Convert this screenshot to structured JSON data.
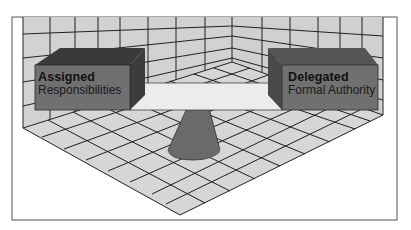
{
  "figure": {
    "left_box": {
      "title": "Assigned",
      "subtitle": "Responsibilities"
    },
    "right_box": {
      "title": "Delegated",
      "subtitle": "Formal Authority"
    }
  },
  "colors": {
    "background": "#ffffff",
    "frame": "#555555",
    "wall_tile": "#d2d2d2",
    "floor_tile": "#d6d6d6",
    "grid_line": "#1e1e1e",
    "box_front": "#707070",
    "box_top": "#3a3a3a",
    "box_side": "#3c3c3c",
    "plank": "#ececec",
    "cone": "#6a6a6a"
  }
}
